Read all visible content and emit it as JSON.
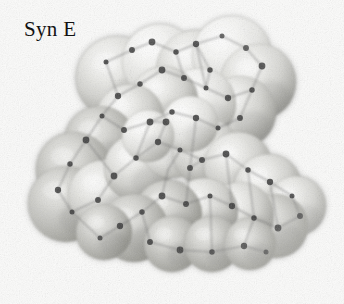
{
  "figure": {
    "label": "Syn E",
    "title": "Syn E",
    "kind": "space-filling molecular model",
    "rendering": "grayscale scanned halftone",
    "background_color": "#fbfbfa",
    "label_color": "#111111",
    "atom_dot_color": "#3a3a3a",
    "bond_line_color": "#6e6e6e",
    "sphere_light_color": "#f2f2f0",
    "sphere_mid_color": "#c9c9c6",
    "sphere_dark_color": "#8e8e8b",
    "sphere_shadow_color": "#6f6f6d"
  },
  "chart_data": {
    "type": "scatter",
    "title": "Syn E",
    "xlabel": "",
    "ylabel": "",
    "xlim": [
      0,
      344
    ],
    "ylim": [
      0,
      304
    ],
    "grid": false,
    "legend": "none",
    "annotations": [
      "Syn E"
    ],
    "spheres": [
      {
        "cx": 118,
        "cy": 78,
        "r": 42,
        "tone": 0.52
      },
      {
        "cx": 160,
        "cy": 62,
        "r": 38,
        "tone": 0.4
      },
      {
        "cx": 196,
        "cy": 70,
        "r": 40,
        "tone": 0.46
      },
      {
        "cx": 232,
        "cy": 56,
        "r": 40,
        "tone": 0.36
      },
      {
        "cx": 258,
        "cy": 82,
        "r": 38,
        "tone": 0.48
      },
      {
        "cx": 240,
        "cy": 112,
        "r": 36,
        "tone": 0.44
      },
      {
        "cx": 200,
        "cy": 104,
        "r": 36,
        "tone": 0.34
      },
      {
        "cx": 164,
        "cy": 100,
        "r": 34,
        "tone": 0.42
      },
      {
        "cx": 130,
        "cy": 118,
        "r": 34,
        "tone": 0.5
      },
      {
        "cx": 100,
        "cy": 142,
        "r": 36,
        "tone": 0.56
      },
      {
        "cx": 74,
        "cy": 170,
        "r": 38,
        "tone": 0.6
      },
      {
        "cx": 66,
        "cy": 204,
        "r": 38,
        "tone": 0.62
      },
      {
        "cx": 104,
        "cy": 196,
        "r": 36,
        "tone": 0.5
      },
      {
        "cx": 138,
        "cy": 168,
        "r": 34,
        "tone": 0.42
      },
      {
        "cx": 172,
        "cy": 146,
        "r": 32,
        "tone": 0.38
      },
      {
        "cx": 206,
        "cy": 152,
        "r": 34,
        "tone": 0.44
      },
      {
        "cx": 238,
        "cy": 166,
        "r": 34,
        "tone": 0.46
      },
      {
        "cx": 268,
        "cy": 188,
        "r": 34,
        "tone": 0.42
      },
      {
        "cx": 296,
        "cy": 206,
        "r": 30,
        "tone": 0.5
      },
      {
        "cx": 276,
        "cy": 226,
        "r": 32,
        "tone": 0.56
      },
      {
        "cx": 240,
        "cy": 216,
        "r": 34,
        "tone": 0.54
      },
      {
        "cx": 204,
        "cy": 212,
        "r": 34,
        "tone": 0.52
      },
      {
        "cx": 168,
        "cy": 214,
        "r": 34,
        "tone": 0.56
      },
      {
        "cx": 134,
        "cy": 228,
        "r": 34,
        "tone": 0.6
      },
      {
        "cx": 172,
        "cy": 244,
        "r": 28,
        "tone": 0.64
      },
      {
        "cx": 212,
        "cy": 244,
        "r": 28,
        "tone": 0.62
      },
      {
        "cx": 250,
        "cy": 244,
        "r": 26,
        "tone": 0.6
      },
      {
        "cx": 104,
        "cy": 232,
        "r": 28,
        "tone": 0.64
      },
      {
        "cx": 190,
        "cy": 124,
        "r": 28,
        "tone": 0.36
      },
      {
        "cx": 148,
        "cy": 136,
        "r": 26,
        "tone": 0.4
      }
    ],
    "atom_centers": [
      {
        "x": 106,
        "y": 62
      },
      {
        "x": 132,
        "y": 50
      },
      {
        "x": 152,
        "y": 42
      },
      {
        "x": 176,
        "y": 52
      },
      {
        "x": 196,
        "y": 44
      },
      {
        "x": 222,
        "y": 36
      },
      {
        "x": 246,
        "y": 48
      },
      {
        "x": 262,
        "y": 66
      },
      {
        "x": 252,
        "y": 90
      },
      {
        "x": 228,
        "y": 98
      },
      {
        "x": 206,
        "y": 88
      },
      {
        "x": 184,
        "y": 78
      },
      {
        "x": 162,
        "y": 70
      },
      {
        "x": 140,
        "y": 84
      },
      {
        "x": 118,
        "y": 96
      },
      {
        "x": 102,
        "y": 116
      },
      {
        "x": 124,
        "y": 130
      },
      {
        "x": 150,
        "y": 122
      },
      {
        "x": 172,
        "y": 112
      },
      {
        "x": 196,
        "y": 118
      },
      {
        "x": 218,
        "y": 128
      },
      {
        "x": 240,
        "y": 118
      },
      {
        "x": 86,
        "y": 140
      },
      {
        "x": 70,
        "y": 164
      },
      {
        "x": 58,
        "y": 190
      },
      {
        "x": 72,
        "y": 212
      },
      {
        "x": 98,
        "y": 200
      },
      {
        "x": 114,
        "y": 176
      },
      {
        "x": 136,
        "y": 158
      },
      {
        "x": 158,
        "y": 142
      },
      {
        "x": 180,
        "y": 150
      },
      {
        "x": 202,
        "y": 160
      },
      {
        "x": 226,
        "y": 154
      },
      {
        "x": 248,
        "y": 170
      },
      {
        "x": 270,
        "y": 182
      },
      {
        "x": 292,
        "y": 196
      },
      {
        "x": 300,
        "y": 216
      },
      {
        "x": 278,
        "y": 228
      },
      {
        "x": 254,
        "y": 218
      },
      {
        "x": 232,
        "y": 206
      },
      {
        "x": 210,
        "y": 196
      },
      {
        "x": 186,
        "y": 204
      },
      {
        "x": 162,
        "y": 196
      },
      {
        "x": 142,
        "y": 212
      },
      {
        "x": 120,
        "y": 226
      },
      {
        "x": 100,
        "y": 238
      },
      {
        "x": 150,
        "y": 242
      },
      {
        "x": 180,
        "y": 250
      },
      {
        "x": 212,
        "y": 252
      },
      {
        "x": 244,
        "y": 246
      },
      {
        "x": 266,
        "y": 252
      },
      {
        "x": 190,
        "y": 168
      },
      {
        "x": 166,
        "y": 122
      },
      {
        "x": 210,
        "y": 70
      }
    ],
    "bonds": [
      [
        106,
        62,
        132,
        50
      ],
      [
        132,
        50,
        152,
        42
      ],
      [
        152,
        42,
        176,
        52
      ],
      [
        176,
        52,
        196,
        44
      ],
      [
        196,
        44,
        222,
        36
      ],
      [
        222,
        36,
        246,
        48
      ],
      [
        246,
        48,
        262,
        66
      ],
      [
        262,
        66,
        252,
        90
      ],
      [
        252,
        90,
        228,
        98
      ],
      [
        228,
        98,
        206,
        88
      ],
      [
        206,
        88,
        184,
        78
      ],
      [
        184,
        78,
        162,
        70
      ],
      [
        162,
        70,
        140,
        84
      ],
      [
        140,
        84,
        118,
        96
      ],
      [
        118,
        96,
        102,
        116
      ],
      [
        102,
        116,
        124,
        130
      ],
      [
        124,
        130,
        150,
        122
      ],
      [
        150,
        122,
        172,
        112
      ],
      [
        172,
        112,
        196,
        118
      ],
      [
        196,
        118,
        218,
        128
      ],
      [
        218,
        128,
        240,
        118
      ],
      [
        240,
        118,
        252,
        90
      ],
      [
        176,
        52,
        184,
        78
      ],
      [
        196,
        44,
        206,
        88
      ],
      [
        106,
        62,
        118,
        96
      ],
      [
        102,
        116,
        86,
        140
      ],
      [
        86,
        140,
        70,
        164
      ],
      [
        70,
        164,
        58,
        190
      ],
      [
        58,
        190,
        72,
        212
      ],
      [
        72,
        212,
        98,
        200
      ],
      [
        98,
        200,
        114,
        176
      ],
      [
        114,
        176,
        86,
        140
      ],
      [
        114,
        176,
        136,
        158
      ],
      [
        136,
        158,
        158,
        142
      ],
      [
        158,
        142,
        180,
        150
      ],
      [
        180,
        150,
        202,
        160
      ],
      [
        202,
        160,
        226,
        154
      ],
      [
        226,
        154,
        248,
        170
      ],
      [
        248,
        170,
        270,
        182
      ],
      [
        270,
        182,
        292,
        196
      ],
      [
        292,
        196,
        300,
        216
      ],
      [
        300,
        216,
        278,
        228
      ],
      [
        278,
        228,
        254,
        218
      ],
      [
        254,
        218,
        232,
        206
      ],
      [
        232,
        206,
        210,
        196
      ],
      [
        210,
        196,
        186,
        204
      ],
      [
        186,
        204,
        162,
        196
      ],
      [
        162,
        196,
        142,
        212
      ],
      [
        142,
        212,
        120,
        226
      ],
      [
        120,
        226,
        100,
        238
      ],
      [
        100,
        238,
        72,
        212
      ],
      [
        142,
        212,
        150,
        242
      ],
      [
        150,
        242,
        180,
        250
      ],
      [
        180,
        250,
        212,
        252
      ],
      [
        212,
        252,
        244,
        246
      ],
      [
        244,
        246,
        266,
        252
      ],
      [
        212,
        252,
        210,
        196
      ],
      [
        244,
        246,
        254,
        218
      ],
      [
        186,
        204,
        190,
        168
      ],
      [
        190,
        168,
        202,
        160
      ],
      [
        158,
        142,
        166,
        122
      ],
      [
        166,
        122,
        150,
        122
      ],
      [
        150,
        122,
        136,
        158
      ],
      [
        196,
        118,
        190,
        168
      ],
      [
        226,
        154,
        232,
        206
      ],
      [
        270,
        182,
        278,
        228
      ],
      [
        162,
        196,
        168,
        170
      ],
      [
        168,
        170,
        180,
        150
      ],
      [
        210,
        70,
        206,
        88
      ],
      [
        210,
        70,
        196,
        44
      ],
      [
        248,
        170,
        254,
        218
      ]
    ]
  }
}
